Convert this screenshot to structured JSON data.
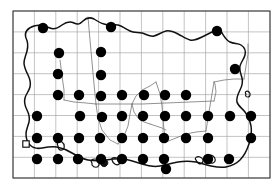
{
  "figure": {
    "kind": "distribution-dot-map",
    "region_name": "Jersey",
    "caption": "",
    "background_color": "#ffffff"
  },
  "frame": {
    "x": 13,
    "y": 11,
    "width": 257,
    "height": 167,
    "stroke_color": "#3d3d3d"
  },
  "grid": {
    "visible": true,
    "columns": 12,
    "rows": 8,
    "cell_width": 21.4,
    "cell_height": 20.9,
    "stroke_color": "#9a9a9a",
    "x_lines": [
      13,
      34.4,
      55.8,
      77.2,
      98.6,
      120,
      141.4,
      162.8,
      184.2,
      205.6,
      227,
      248.4,
      270
    ],
    "y_lines": [
      11,
      31.9,
      52.8,
      73.7,
      94.6,
      115.5,
      136.4,
      157.3,
      178
    ]
  },
  "layers": {
    "coastline": {
      "name": "island-coastline",
      "stroke_color": "#111111"
    },
    "parish_boundaries": {
      "name": "parish-boundaries",
      "stroke_color": "#6d6d6d"
    },
    "records": {
      "name": "record-dots",
      "symbol": "filled-circle",
      "fill_color": "#000000",
      "radius": 5.2,
      "count": 45
    },
    "open_record": {
      "name": "open-square-record",
      "symbol": "open-square",
      "fill_color": "#ffffff",
      "stroke_color": "#000000",
      "count": 1
    }
  },
  "chart_data": {
    "type": "scatter",
    "title": "",
    "xlabel": "",
    "ylabel": "",
    "xlim": [
      13,
      270
    ],
    "ylim": [
      11,
      178
    ],
    "grid": true,
    "legend": null,
    "series": [
      {
        "name": "Recorded presence",
        "symbol": "filled-circle",
        "color": "#000000",
        "points": [
          [
            43,
            28
          ],
          [
            111,
            27
          ],
          [
            217,
            31
          ],
          [
            59,
            53
          ],
          [
            101,
            52
          ],
          [
            235,
            69
          ],
          [
            58,
            74
          ],
          [
            80,
            116
          ],
          [
            101,
            96
          ],
          [
            79,
            95
          ],
          [
            102,
            117
          ],
          [
            58,
            95
          ],
          [
            79,
            138
          ],
          [
            100,
            138
          ],
          [
            122,
            116
          ],
          [
            122,
            138
          ],
          [
            143,
            116
          ],
          [
            143,
            138
          ],
          [
            165,
            116
          ],
          [
            164,
            138
          ],
          [
            186,
            116
          ],
          [
            101,
            159
          ],
          [
            122,
            159
          ],
          [
            143,
            159
          ],
          [
            164,
            159
          ],
          [
            101,
            75
          ],
          [
            122,
            95
          ],
          [
            165,
            95
          ],
          [
            144,
            95
          ],
          [
            186,
            95
          ],
          [
            208,
            116
          ],
          [
            37,
            116
          ],
          [
            37,
            138
          ],
          [
            37,
            159
          ],
          [
            58,
            138
          ],
          [
            58,
            159
          ],
          [
            78,
            159
          ],
          [
            186,
            138
          ],
          [
            208,
            138
          ],
          [
            230,
            116
          ],
          [
            251,
            116
          ],
          [
            251,
            138
          ],
          [
            208,
            159
          ],
          [
            229,
            159
          ],
          [
            166,
            169
          ]
        ]
      },
      {
        "name": "Open record",
        "symbol": "open-square",
        "color": "#000000",
        "points": [
          [
            26,
            144
          ]
        ]
      }
    ]
  }
}
